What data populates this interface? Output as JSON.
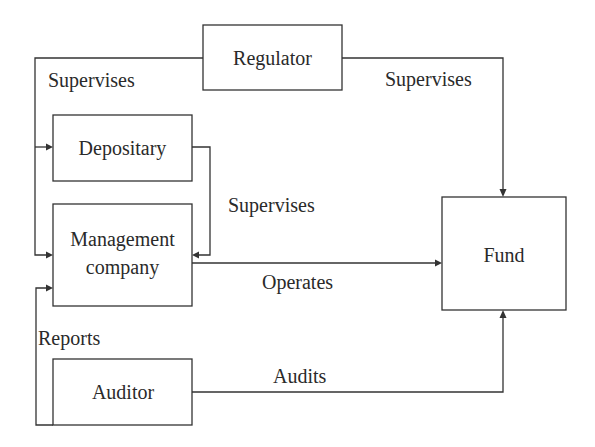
{
  "diagram": {
    "nodes": {
      "regulator": "Regulator",
      "depositary": "Depositary",
      "management_line1": "Management",
      "management_line2": "company",
      "fund": "Fund",
      "auditor": "Auditor"
    },
    "edges": [
      {
        "from": "Regulator",
        "to": "Depositary",
        "label": "Supervises"
      },
      {
        "from": "Regulator",
        "to": "Management company",
        "label": "Supervises"
      },
      {
        "from": "Regulator",
        "to": "Fund",
        "label": "Supervises"
      },
      {
        "from": "Depositary",
        "to": "Management company",
        "label": "Supervises"
      },
      {
        "from": "Management company",
        "to": "Fund",
        "label": "Operates"
      },
      {
        "from": "Auditor",
        "to": "Management company",
        "label": "Reports"
      },
      {
        "from": "Auditor",
        "to": "Fund",
        "label": "Audits"
      }
    ],
    "labels": {
      "regulator_left": "Supervises",
      "regulator_right": "Supervises",
      "depositary_mgmt": "Supervises",
      "operates": "Operates",
      "reports": "Reports",
      "audits": "Audits"
    },
    "colors": {
      "stroke": "#333333",
      "text": "#2a2a2a",
      "background": "#ffffff"
    }
  }
}
